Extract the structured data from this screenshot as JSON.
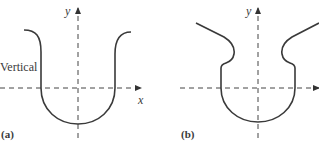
{
  "figure": {
    "panels": [
      {
        "id": "a",
        "label": "(a)",
        "axis_x_label": "x",
        "axis_y_label": "y",
        "annotation": "Vertical",
        "description": "U-shaped curve with vertical sides crossing the x-axis"
      },
      {
        "id": "b",
        "label": "(b)",
        "axis_y_label": "y",
        "description": "Bulb-shaped curve with outward-sloping arms and indented shoulders"
      }
    ],
    "colors": {
      "curve": "#3a3a3a",
      "axis": "#444444",
      "background": "#ffffff"
    }
  }
}
